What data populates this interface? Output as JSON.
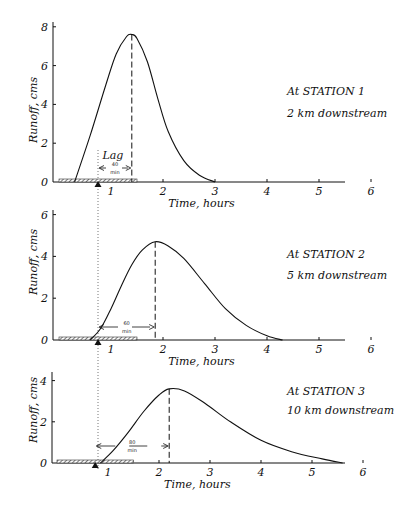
{
  "chart_data": [
    {
      "type": "line",
      "title": "At STATION 1",
      "subtitle": "2 km downstream",
      "xlabel": "Time, hours",
      "ylabel": "Runoff, cms",
      "xticks": [
        1,
        2,
        3,
        4,
        5,
        6
      ],
      "yticks": [
        0,
        2,
        4,
        6,
        8
      ],
      "xlim": [
        0,
        6.3
      ],
      "ylim": [
        0,
        8
      ],
      "x": [
        0.3,
        0.6,
        0.9,
        1.1,
        1.3,
        1.4,
        1.5,
        1.7,
        1.9,
        2.1,
        2.4,
        2.7,
        3.0
      ],
      "values": [
        0,
        2.4,
        5.0,
        6.6,
        7.5,
        7.6,
        7.4,
        6.2,
        4.3,
        2.6,
        1.1,
        0.35,
        0
      ],
      "peak": {
        "time": 1.4,
        "runoff": 7.6
      },
      "lag_label": "Lag",
      "lag": {
        "value": "40",
        "unit": "min"
      },
      "rainfall_bar": {
        "start": 0,
        "end": 1.5
      },
      "rainfall_centroid": 0.75
    },
    {
      "type": "line",
      "title": "At STATION 2",
      "subtitle": "5 km downstream",
      "xlabel": "Time, hours",
      "ylabel": "Runoff, cms",
      "xticks": [
        1,
        2,
        3,
        4,
        5,
        6
      ],
      "yticks": [
        0,
        2,
        4,
        6
      ],
      "xlim": [
        0,
        6.3
      ],
      "ylim": [
        0,
        6
      ],
      "x": [
        0.6,
        0.8,
        1.0,
        1.2,
        1.4,
        1.6,
        1.85,
        2.1,
        2.4,
        2.8,
        3.2,
        3.6,
        4.0,
        4.3
      ],
      "values": [
        0,
        0.55,
        1.5,
        2.6,
        3.6,
        4.3,
        4.7,
        4.5,
        3.9,
        2.7,
        1.5,
        0.7,
        0.2,
        0
      ],
      "peak": {
        "time": 1.85,
        "runoff": 4.7
      },
      "lag": {
        "value": "60",
        "unit": "min"
      },
      "rainfall_bar": {
        "start": 0,
        "end": 1.5
      },
      "rainfall_centroid": 0.75
    },
    {
      "type": "line",
      "title": "At STATION 3",
      "subtitle": "10 km downstream",
      "xlabel": "Time, hours",
      "ylabel": "Runoff, cms",
      "xticks": [
        1,
        2,
        3,
        4,
        5,
        6
      ],
      "yticks": [
        0,
        2,
        4
      ],
      "xlim": [
        0,
        6.3
      ],
      "ylim": [
        0,
        4.5
      ],
      "x": [
        0.85,
        1.1,
        1.4,
        1.7,
        2.0,
        2.2,
        2.5,
        2.9,
        3.4,
        4.0,
        4.6,
        5.2,
        5.6
      ],
      "values": [
        0,
        0.6,
        1.5,
        2.5,
        3.3,
        3.6,
        3.5,
        2.9,
        2.0,
        1.1,
        0.55,
        0.2,
        0
      ],
      "peak": {
        "time": 2.2,
        "runoff": 3.6
      },
      "lag": {
        "value": "80",
        "unit": "min"
      },
      "rainfall_bar": {
        "start": 0,
        "end": 1.5
      },
      "rainfall_centroid": 0.75
    }
  ],
  "panels": [
    {
      "title": "At STATION 1",
      "subtitle": "2 km downstream",
      "ylabel": "Runoff, cms",
      "xlabel": "Time, hours",
      "lag_label": "Lag",
      "lag_value": "40",
      "lag_unit": "min"
    },
    {
      "title": "At STATION 2",
      "subtitle": "5 km downstream",
      "ylabel": "Runoff, cms",
      "xlabel": "Time, hours",
      "lag_value": "60",
      "lag_unit": "min"
    },
    {
      "title": "At STATION 3",
      "subtitle": "10 km downstream",
      "ylabel": "Runoff, cms",
      "xlabel": "Time, hours",
      "lag_value": "80",
      "lag_unit": "min"
    }
  ],
  "colors": {
    "ink": "#111111",
    "hatch": "#555555",
    "background": "#ffffff"
  }
}
